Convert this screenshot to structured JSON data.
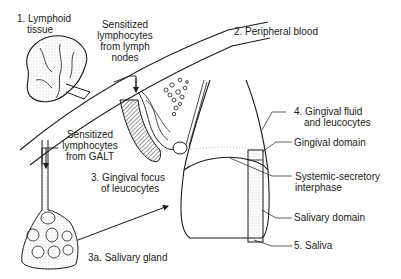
{
  "labels": {
    "lymphoid_tissue": [
      "1. Lymphoid",
      "tissue"
    ],
    "sensitized_lymph_nodes": [
      "Sensitized",
      "lymphocytes",
      "from lymph",
      "nodes"
    ],
    "peripheral_blood": "2. Peripheral blood",
    "sensitized_galt": [
      "Sensitized",
      "lymphocytes",
      "from GALT"
    ],
    "gingival_focus": [
      "3. Gingival focus",
      "of leucocytes"
    ],
    "salivary_gland": "3a. Salivary gland",
    "gingival_fluid": [
      "4. Gingival fluid",
      "and leucocytes"
    ],
    "gingival_domain": "Gingival domain",
    "systemic_secretory": [
      "Systemic-secretory",
      "interphase"
    ],
    "salivary_domain": "Salivary domain",
    "saliva": "5. Saliva"
  },
  "colors": {
    "ink": "#1a1a1a",
    "stipple": "#8a8a8a",
    "gum_shade": "#7a7a7a"
  }
}
